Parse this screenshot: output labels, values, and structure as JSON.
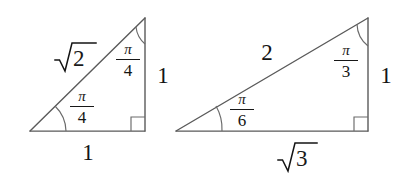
{
  "figure": {
    "kind": "geometry-diagram",
    "background_color": "#ffffff",
    "stroke_color": "#4d4d4d",
    "text_color": "#141414",
    "width": 397,
    "height": 181
  },
  "triangles": [
    {
      "name": "45-45-90-triangle",
      "vertices": {
        "left": [
          30,
          131
        ],
        "right_angle": [
          145,
          131
        ],
        "apex": [
          145,
          18
        ]
      },
      "labels": {
        "hypotenuse": "√2",
        "hypotenuse_radicand": "2",
        "vertical_leg": "1",
        "horizontal_leg": "1",
        "angle_apex_numerator": "π",
        "angle_apex_denominator": "4",
        "angle_left_numerator": "π",
        "angle_left_denominator": "4"
      }
    },
    {
      "name": "30-60-90-triangle",
      "vertices": {
        "left": [
          176,
          131
        ],
        "right_angle": [
          368,
          131
        ],
        "apex": [
          368,
          18
        ]
      },
      "labels": {
        "hypotenuse": "2",
        "vertical_leg": "1",
        "horizontal_leg": "√3",
        "horizontal_leg_radicand": "3",
        "angle_apex_numerator": "π",
        "angle_apex_denominator": "3",
        "angle_left_numerator": "π",
        "angle_left_denominator": "6"
      }
    }
  ],
  "marks": {
    "right_angle_square": "right-angle-marker",
    "angle_arc": "angle-arc"
  }
}
